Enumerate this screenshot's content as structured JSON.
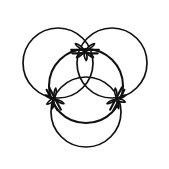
{
  "figure": {
    "title": "Three interlocking circles with knot rosettes",
    "background_color": "#ffffff",
    "stroke_color": "#111111",
    "canvas": {
      "width": 169,
      "height": 169
    },
    "circles": [
      {
        "name": "top-left-circle",
        "cx": 58,
        "cy": 63,
        "r": 35,
        "stroke_width": 1.7,
        "label": "Top left circle"
      },
      {
        "name": "top-right-circle",
        "cx": 112,
        "cy": 63,
        "r": 35,
        "stroke_width": 1.7,
        "label": "Top right circle"
      },
      {
        "name": "bottom-circle",
        "cx": 86,
        "cy": 112,
        "r": 35,
        "stroke_width": 1.7,
        "label": "Bottom circle"
      },
      {
        "name": "center-front-circle",
        "cx": 86,
        "cy": 86,
        "r": 37,
        "stroke_width": 2.1,
        "label": "Center front circle"
      }
    ],
    "knots": [
      {
        "name": "top-knot",
        "cx": 85,
        "cy": 51,
        "rotation": 0,
        "petal_length": 12,
        "petal_width": 4.4,
        "label": "Top crossing rosette"
      },
      {
        "name": "left-knot",
        "cx": 54,
        "cy": 99,
        "rotation": 62,
        "petal_length": 11,
        "petal_width": 4.2,
        "label": "Left crossing rosette"
      },
      {
        "name": "right-knot",
        "cx": 117,
        "cy": 99,
        "rotation": -62,
        "petal_length": 11,
        "petal_width": 4.2,
        "label": "Right crossing rosette"
      }
    ]
  }
}
